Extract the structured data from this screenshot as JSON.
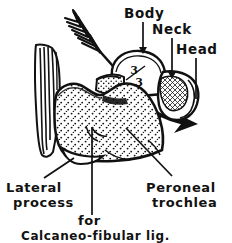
{
  "figure": {
    "background_color": "#ffffff",
    "ink_color": "#111111",
    "labels": {
      "body": "Body",
      "neck": "Neck",
      "head": "Head",
      "lateral_process_line1": "Lateral",
      "lateral_process_line2": "process",
      "peroneal_line1": "Peroneal",
      "peroneal_line2": "trochlea",
      "ligament_line1": "for",
      "ligament_line2": "Calcaneo-fibular lig."
    },
    "marks": {
      "fraction_numerator": "3",
      "fraction_denominator": "3"
    },
    "parts": [
      {
        "name": "arrow",
        "description": "fletched arrow passing obliquely through bone"
      },
      {
        "name": "tendon",
        "description": "striated tendon at left"
      },
      {
        "name": "calcaneus-body",
        "description": "stippled heel bone body"
      },
      {
        "name": "talus-body",
        "description": "dome shaped body with fraction mark"
      },
      {
        "name": "talus-head",
        "description": "cross-hatched head region"
      }
    ]
  }
}
